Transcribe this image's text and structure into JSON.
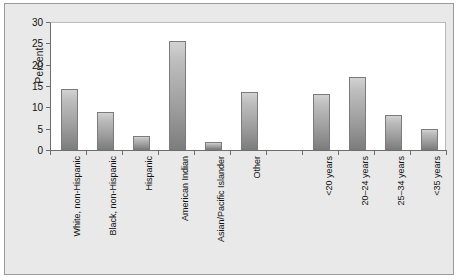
{
  "chart_data": {
    "type": "bar",
    "title": "",
    "xlabel": "",
    "ylabel": "Percent",
    "ylim": [
      0,
      30
    ],
    "yticks": [
      0,
      5,
      10,
      15,
      20,
      25,
      30
    ],
    "grid": false,
    "legend": null,
    "categories": [
      "White, non-Hispanic",
      "Black, non-Hispanic",
      "Hispanic",
      "American Indian",
      "Asian/Pacific Islander",
      "Other",
      "",
      "<20 years",
      "20–24 years",
      "25–34 years",
      "<35 years"
    ],
    "values": [
      14.3,
      8.8,
      3.4,
      25.5,
      1.8,
      13.5,
      null,
      13.1,
      17.1,
      8.2,
      5.0
    ],
    "groups": [
      {
        "name": "Race/Ethnicity",
        "categories": [
          "White, non-Hispanic",
          "Black, non-Hispanic",
          "Hispanic",
          "American Indian",
          "Asian/Pacific Islander",
          "Other"
        ]
      },
      {
        "name": "Age",
        "categories": [
          "<20 years",
          "20–24 years",
          "25–34 years",
          "<35 years"
        ]
      }
    ]
  },
  "colors": {
    "panel_background": "#e9e9e9",
    "plot_background": "#ffffff",
    "panel_border": "#9a9a9a",
    "axis": "#6d6d6d",
    "bar_top": "#d2d2d2",
    "bar_bottom": "#7d7d7d",
    "bar_border": "#7b7b7b",
    "text": "#111111"
  }
}
